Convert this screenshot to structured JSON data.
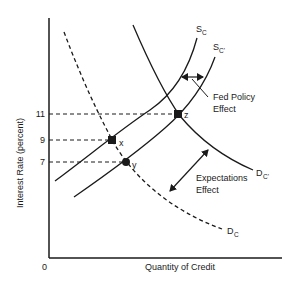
{
  "diagram": {
    "type": "supply-demand-credit",
    "axes": {
      "ylabel": "Interest Rate (percent)",
      "xlabel": "Quantity of Credit",
      "origin_label": "0",
      "y_ticks": [
        "11",
        "9",
        "7"
      ]
    },
    "curves": {
      "supply_original": {
        "main": "S",
        "sub": "C"
      },
      "supply_shifted": {
        "main": "S",
        "sub": "C'"
      },
      "demand_original": {
        "main": "D",
        "sub": "C"
      },
      "demand_shifted": {
        "main": "D",
        "sub": "C'"
      }
    },
    "points": [
      {
        "label": "x",
        "rate": 9
      },
      {
        "label": "y",
        "rate": 7
      },
      {
        "label": "z",
        "rate": 11
      }
    ],
    "annotations": {
      "fed_policy_line1": "Fed Policy",
      "fed_policy_line2": "Effect",
      "expectations_line1": "Expectations",
      "expectations_line2": "Effect"
    },
    "colors": {
      "ink": "#1a1a1a",
      "background": "#ffffff"
    }
  }
}
